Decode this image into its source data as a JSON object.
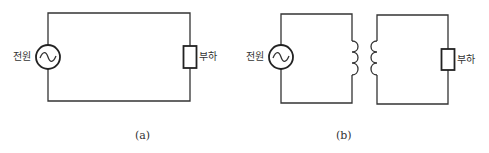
{
  "diagram": {
    "panels": [
      {
        "id": "a",
        "caption": "(a)",
        "source_label": "전원",
        "load_label": "부하",
        "components": [
          "ac-source",
          "wire",
          "load-resistor"
        ]
      },
      {
        "id": "b",
        "caption": "(b)",
        "source_label": "전원",
        "load_label": "부하",
        "components": [
          "ac-source",
          "primary-coil",
          "secondary-coil",
          "load-resistor"
        ]
      }
    ],
    "colors": {
      "line": "#333333",
      "background": "#ffffff"
    }
  }
}
